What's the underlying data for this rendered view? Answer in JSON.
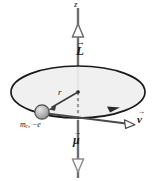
{
  "figure": {
    "type": "physics-vector-diagram",
    "width": 160,
    "height": 181,
    "background": "#ffffff"
  },
  "colors": {
    "axis": "#6e6e6e",
    "outline": "#1a1a1a",
    "disk_fill": "#efefef",
    "vector": "#4a4a4a",
    "particle_fill": "#b3b3b3",
    "particle_stroke": "#4d4d4d",
    "text": "#1a1a1a"
  },
  "labels": {
    "z_axis": "z",
    "angular_momentum": "L",
    "angular_momentum_accent": "→",
    "radius": "r",
    "particle": "mₑ, −e",
    "velocity": "v",
    "velocity_accent": "→",
    "magnetic_moment": "μ",
    "magnetic_moment_accent": "→"
  },
  "elements": {
    "z_axis": {
      "name": "vertical-z-axis",
      "from": [
        78,
        8
      ],
      "to": [
        78,
        178
      ],
      "dashed_segment": [
        92,
        120
      ]
    },
    "angular_momentum_arrow": {
      "name": "L-vector-arrowhead",
      "direction": "up",
      "tip": [
        78,
        24
      ],
      "style": "open-triangle"
    },
    "magnetic_moment_arrow": {
      "name": "mu-vector-arrowhead",
      "direction": "down",
      "tip": [
        78,
        172
      ],
      "style": "open-triangle"
    },
    "orbit_disk": {
      "name": "orbital-plane-ellipse",
      "center": [
        78,
        92
      ],
      "rx": 67,
      "ry": 26
    },
    "orbit_direction_arrow": {
      "name": "orbit-direction-arrowhead",
      "at": [
        112,
        109
      ],
      "style": "filled-triangle",
      "sense": "clockwise-from-above"
    },
    "particle": {
      "name": "electron-sphere",
      "center": [
        42,
        112
      ],
      "radius": 7
    },
    "radius_vector": {
      "name": "r-vector",
      "from": [
        78,
        92
      ],
      "to": [
        48,
        109
      ]
    },
    "velocity_vector": {
      "name": "v-vector",
      "from": [
        42,
        112
      ],
      "to": [
        130,
        124
      ]
    }
  }
}
